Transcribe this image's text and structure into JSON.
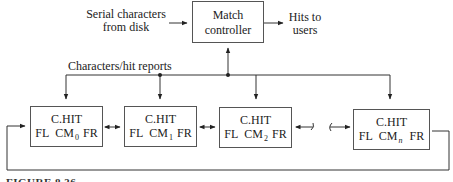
{
  "diagram": {
    "input_label_line1": "Serial characters",
    "input_label_line2": "from disk",
    "controller_line1": "Match",
    "controller_line2": "controller",
    "output_label_line1": "Hits to",
    "output_label_line2": "users",
    "bus_label": "Characters/hit reports",
    "cells": [
      {
        "title": "C.HIT",
        "left_field": "FL",
        "module": "CM",
        "subscript": "0",
        "right_field": "FR"
      },
      {
        "title": "C.HIT",
        "left_field": "FL",
        "module": "CM",
        "subscript": "1",
        "right_field": "FR"
      },
      {
        "title": "C.HIT",
        "left_field": "FL",
        "module": "CM",
        "subscript": "2",
        "right_field": "FR"
      },
      {
        "title": "C.HIT",
        "left_field": "FL",
        "module": "CM",
        "subscript": "n",
        "right_field": "FR"
      }
    ],
    "figure_caption": "FIGURE 8.36"
  }
}
